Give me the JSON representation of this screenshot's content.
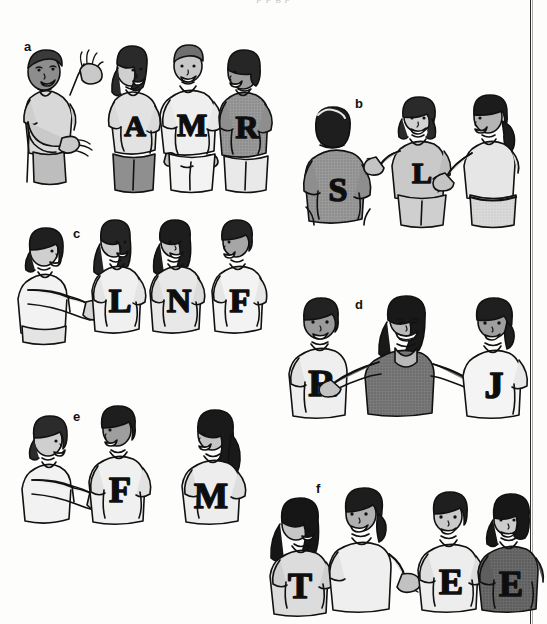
{
  "page": {
    "type": "illustration-plate",
    "kind": "black-and-white textbook line drawing",
    "background_color": "#fdfdfc",
    "ink_color": "#111111",
    "page_rule_color": "#2b2b2b",
    "top_text_sliver": "p  p        g                p"
  },
  "panels": [
    {
      "id": "a",
      "label": "a",
      "label_x": 24,
      "label_y": 40,
      "figures": [
        {
          "role": "introducer",
          "letter": "",
          "pose": "gesturing-both-hands",
          "facing": "right",
          "shirt_tone": "#d8d8d8",
          "hair_tone": "#3a3a3a",
          "skin_tone": "#8d8d8d"
        },
        {
          "role": "listener",
          "letter": "A",
          "pose": "standing",
          "facing": "left",
          "shirt_tone": "#e2e2e2",
          "hair_tone": "#2a2a2a",
          "skin_tone": "#cfcfcf"
        },
        {
          "role": "listener",
          "letter": "M",
          "pose": "standing",
          "facing": "front",
          "shirt_tone": "#efefef",
          "hair_tone": "#6f6f6f",
          "skin_tone": "#c7c7c7"
        },
        {
          "role": "listener",
          "letter": "R",
          "pose": "standing",
          "facing": "left",
          "shirt_tone": "#9a9a9a",
          "hair_tone": "#262626",
          "skin_tone": "#9d9d9d"
        }
      ]
    },
    {
      "id": "b",
      "label": "b",
      "label_x": 355,
      "label_y": 102,
      "figures": [
        {
          "role": "listener",
          "letter": "S",
          "pose": "back-view",
          "facing": "away",
          "shirt_tone": "#909090",
          "hair_tone": "#1e1e1e",
          "skin_tone": "#a8a8a8"
        },
        {
          "role": "introducer",
          "letter": "L",
          "pose": "gesturing-left-hand",
          "facing": "front",
          "shirt_tone": "#c9c9c9",
          "hair_tone": "#2a2a2a",
          "skin_tone": "#d2d2d2"
        },
        {
          "role": "listener",
          "letter": "",
          "pose": "reaching-handshake",
          "facing": "left",
          "shirt_tone": "#e6e6e6",
          "hair_tone": "#1c1c1c",
          "skin_tone": "#b5b5b5"
        }
      ]
    },
    {
      "id": "c",
      "label": "c",
      "label_x": 73,
      "label_y": 227,
      "figures": [
        {
          "role": "introducer",
          "letter": "",
          "pose": "reaching-arm-out",
          "facing": "right",
          "shirt_tone": "#f2f2f2",
          "hair_tone": "#1f1f1f",
          "skin_tone": "#cfcfcf"
        },
        {
          "role": "listener",
          "letter": "L",
          "pose": "standing",
          "facing": "front",
          "shirt_tone": "#f0f0f0",
          "hair_tone": "#242424",
          "skin_tone": "#cccccc"
        },
        {
          "role": "listener",
          "letter": "N",
          "pose": "standing",
          "facing": "front",
          "shirt_tone": "#e8e8e8",
          "hair_tone": "#1d1d1d",
          "skin_tone": "#c8c8c8"
        },
        {
          "role": "listener",
          "letter": "F",
          "pose": "standing",
          "facing": "left",
          "shirt_tone": "#f3f3f3",
          "hair_tone": "#232323",
          "skin_tone": "#a6a6a6"
        }
      ]
    },
    {
      "id": "d",
      "label": "d",
      "label_x": 355,
      "label_y": 302,
      "figures": [
        {
          "role": "listener",
          "letter": "R",
          "pose": "standing",
          "facing": "front",
          "shirt_tone": "#efefef",
          "hair_tone": "#222222",
          "skin_tone": "#9b9b9b"
        },
        {
          "role": "introducer",
          "letter": "",
          "pose": "both-arms-out",
          "facing": "front",
          "shirt_tone": "#7a7a7a",
          "hair_tone": "#191919",
          "skin_tone": "#b9b9b9"
        },
        {
          "role": "listener",
          "letter": "J",
          "pose": "standing",
          "facing": "front",
          "shirt_tone": "#f4f4f4",
          "hair_tone": "#1f1f1f",
          "skin_tone": "#9f9f9f"
        }
      ]
    },
    {
      "id": "e",
      "label": "e",
      "label_x": 73,
      "label_y": 410,
      "figures": [
        {
          "role": "introducer",
          "letter": "",
          "pose": "reaching-arm-out",
          "facing": "right",
          "shirt_tone": "#f2f2f2",
          "hair_tone": "#2b2b2b",
          "skin_tone": "#cfcfcf"
        },
        {
          "role": "listener",
          "letter": "F",
          "pose": "standing",
          "facing": "left",
          "shirt_tone": "#f0f0f0",
          "hair_tone": "#1e1e1e",
          "skin_tone": "#9e9e9e"
        },
        {
          "role": "listener",
          "letter": "M",
          "pose": "standing",
          "facing": "left",
          "shirt_tone": "#ededed",
          "hair_tone": "#1a1a1a",
          "skin_tone": "#c4c4c4"
        }
      ]
    },
    {
      "id": "f",
      "label": "f",
      "label_x": 316,
      "label_y": 487,
      "figures": [
        {
          "role": "listener",
          "letter": "T",
          "pose": "standing",
          "facing": "right",
          "shirt_tone": "#dcdcdc",
          "hair_tone": "#161616",
          "skin_tone": "#c6c6c6"
        },
        {
          "role": "introducer",
          "letter": "",
          "pose": "gesturing-right-hand",
          "facing": "front",
          "shirt_tone": "#efefef",
          "hair_tone": "#1d1d1d",
          "skin_tone": "#b0b0b0"
        },
        {
          "role": "listener",
          "letter": "E",
          "pose": "standing",
          "facing": "front",
          "shirt_tone": "#ededed",
          "hair_tone": "#1f1f1f",
          "skin_tone": "#cacaca"
        },
        {
          "role": "listener",
          "letter": "E",
          "pose": "standing",
          "facing": "front",
          "shirt_tone": "#6a6a6a",
          "hair_tone": "#171717",
          "skin_tone": "#cdcdcd"
        }
      ]
    }
  ]
}
